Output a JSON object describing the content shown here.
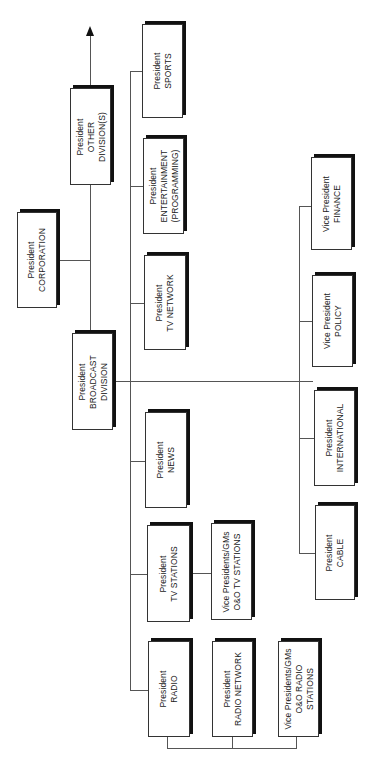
{
  "chart_title": "Broadcast organization chart",
  "nodes": {
    "corporation": {
      "title": "President",
      "unit": "CORPORATION"
    },
    "other_divisions": {
      "title": "President",
      "unit": "OTHER",
      "unit2": "DIVISION(S)"
    },
    "broadcast_division": {
      "title": "President",
      "unit": "BROADCAST",
      "unit2": "DIVISION"
    },
    "sports": {
      "title": "President",
      "unit": "SPORTS"
    },
    "entertainment": {
      "title": "President",
      "unit": "ENTERTAINMENT",
      "unit2": "(PROGRAMMING)"
    },
    "tv_network": {
      "title": "President",
      "unit": "TV NETWORK"
    },
    "news": {
      "title": "President",
      "unit": "NEWS"
    },
    "tv_stations": {
      "title": "President",
      "unit": "TV STATIONS"
    },
    "oo_tv_stations": {
      "title": "Vice Presidents/GMs",
      "unit": "O&O TV STATIONS"
    },
    "radio": {
      "title": "President",
      "unit": "RADIO"
    },
    "radio_network": {
      "title": "President",
      "unit": "RADIO NETWORK"
    },
    "oo_radio_stations": {
      "title": "Vice Presidents/GMs",
      "unit": "O&O RADIO",
      "unit2": "STATIONS"
    },
    "cable": {
      "title": "President",
      "unit": "CABLE"
    },
    "international": {
      "title": "President",
      "unit": "INTERNATIONAL"
    },
    "policy": {
      "title": "Vice President",
      "unit": "POLICY"
    },
    "finance": {
      "title": "Vice President",
      "unit": "FINANCE"
    }
  }
}
